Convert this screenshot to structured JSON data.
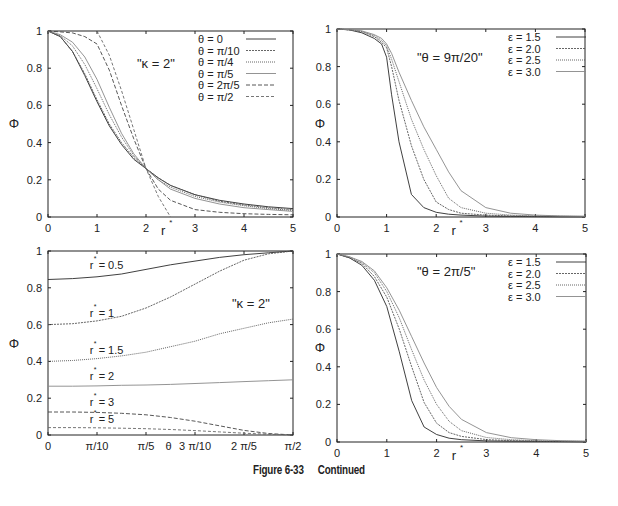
{
  "figure": {
    "caption_number": "Figure 6-33",
    "caption_text": "Continued"
  },
  "chart_data": [
    {
      "id": "top-left",
      "type": "line",
      "title": "",
      "annotation": "\"κ =  2\"",
      "xlabel": "r*",
      "ylabel": "Φ",
      "xlim": [
        0,
        5
      ],
      "ylim": [
        0,
        1
      ],
      "xticks": [
        "0",
        "1",
        "2",
        "3",
        "4",
        "5"
      ],
      "yticks": [
        "0",
        "0.2",
        "0.4",
        "0.6",
        "0.8",
        "1"
      ],
      "legend_position": "top-right",
      "grid": false,
      "x": [
        0,
        0.25,
        0.5,
        0.75,
        1.0,
        1.25,
        1.5,
        1.75,
        2.0,
        2.25,
        2.5,
        3.0,
        3.5,
        4.0,
        4.5,
        5.0
      ],
      "series": [
        {
          "name": "θ =  0",
          "dash": "",
          "values": [
            1.0,
            0.97,
            0.89,
            0.76,
            0.62,
            0.49,
            0.39,
            0.31,
            0.26,
            0.21,
            0.17,
            0.12,
            0.09,
            0.07,
            0.055,
            0.045
          ]
        },
        {
          "name": "θ =  π/10",
          "dash": "2,1",
          "values": [
            1.0,
            0.97,
            0.89,
            0.77,
            0.63,
            0.5,
            0.4,
            0.32,
            0.26,
            0.21,
            0.17,
            0.12,
            0.085,
            0.065,
            0.05,
            0.04
          ]
        },
        {
          "name": "θ =  π/4",
          "dash": "1,1",
          "values": [
            1.0,
            0.975,
            0.92,
            0.82,
            0.69,
            0.55,
            0.43,
            0.33,
            0.26,
            0.2,
            0.16,
            0.11,
            0.08,
            0.06,
            0.045,
            0.035
          ]
        },
        {
          "name": "θ =  π/5",
          "dash": "",
          "values": [
            1.0,
            0.98,
            0.94,
            0.86,
            0.74,
            0.59,
            0.45,
            0.34,
            0.26,
            0.2,
            0.15,
            0.1,
            0.07,
            0.05,
            0.04,
            0.03
          ]
        },
        {
          "name": "θ =  2π/5",
          "dash": "4,2",
          "values": [
            1.0,
            0.995,
            0.99,
            0.97,
            0.93,
            0.79,
            0.6,
            0.42,
            0.26,
            0.15,
            0.09,
            0.04,
            0.025,
            0.018,
            0.014,
            0.012
          ]
        },
        {
          "name": "θ =  π/2",
          "dash": "3,2",
          "values": [
            null,
            null,
            null,
            null,
            1.0,
            0.87,
            0.68,
            0.47,
            0.26,
            0.11,
            0.0,
            null,
            null,
            null,
            null,
            null
          ]
        }
      ]
    },
    {
      "id": "top-right",
      "type": "line",
      "annotation": "\"θ =  9π/20\"",
      "xlabel": "r*",
      "ylabel": "Φ",
      "xlim": [
        0,
        5
      ],
      "ylim": [
        0,
        1
      ],
      "xticks": [
        "0",
        "1",
        "2",
        "3",
        "4",
        "5"
      ],
      "yticks": [
        "0",
        "0.2",
        "0.4",
        "0.6",
        "0.8",
        "1"
      ],
      "legend_position": "top-right",
      "grid": false,
      "x": [
        0,
        0.25,
        0.5,
        0.75,
        0.9,
        1.0,
        1.1,
        1.25,
        1.5,
        1.75,
        2.0,
        2.25,
        2.5,
        3.0,
        3.5,
        4.0,
        4.5,
        5.0
      ],
      "series": [
        {
          "name": "ε = 1.5",
          "dash": "",
          "values": [
            1.0,
            0.995,
            0.98,
            0.95,
            0.92,
            0.85,
            0.65,
            0.4,
            0.12,
            0.05,
            0.025,
            0.015,
            0.01,
            0.005,
            0.003,
            0.002,
            0.001,
            0.001
          ]
        },
        {
          "name": "ε = 2.0",
          "dash": "2,1",
          "values": [
            1.0,
            0.995,
            0.985,
            0.96,
            0.93,
            0.9,
            0.8,
            0.62,
            0.38,
            0.2,
            0.08,
            0.04,
            0.02,
            0.01,
            0.006,
            0.004,
            0.003,
            0.002
          ]
        },
        {
          "name": "ε = 2.5",
          "dash": "1,1",
          "values": [
            1.0,
            0.996,
            0.988,
            0.965,
            0.94,
            0.91,
            0.84,
            0.72,
            0.52,
            0.36,
            0.22,
            0.1,
            0.05,
            0.02,
            0.01,
            0.006,
            0.004,
            0.003
          ]
        },
        {
          "name": "ε = 3.0",
          "dash": "",
          "values": [
            1.0,
            0.997,
            0.99,
            0.97,
            0.95,
            0.92,
            0.87,
            0.77,
            0.62,
            0.48,
            0.36,
            0.24,
            0.14,
            0.05,
            0.02,
            0.01,
            0.006,
            0.004
          ]
        }
      ]
    },
    {
      "id": "bottom-left",
      "type": "line",
      "annotation": "\"κ = 2\"",
      "xlabel": "θ",
      "ylabel": "Φ",
      "xlim": [
        0,
        1.5708
      ],
      "ylim": [
        0,
        1
      ],
      "xticks": [
        "0",
        "π/10",
        "π/5",
        "3 π/10",
        "2 π/5",
        "π/2"
      ],
      "yticks": [
        "0",
        "0.2",
        "0.4",
        "0.6",
        "0.8",
        "1"
      ],
      "grid": false,
      "x": [
        0,
        0.1,
        0.2,
        0.3,
        0.4,
        0.5,
        0.6,
        0.7,
        0.8,
        0.9,
        1.0
      ],
      "x_note": "fraction of π/2",
      "series": [
        {
          "name": "r* = 0.5",
          "label": "r* = 0.5",
          "dash": "",
          "values": [
            0.845,
            0.85,
            0.86,
            0.875,
            0.9,
            0.925,
            0.945,
            0.965,
            0.98,
            0.99,
            1.0
          ]
        },
        {
          "name": "r* = 1",
          "label": "r* = 1",
          "dash": "2,1",
          "values": [
            0.6,
            0.605,
            0.62,
            0.645,
            0.69,
            0.75,
            0.82,
            0.89,
            0.95,
            0.985,
            1.0
          ]
        },
        {
          "name": "r* = 1.5",
          "label": "r* = 1.5",
          "dash": "1,1",
          "values": [
            0.4,
            0.405,
            0.415,
            0.43,
            0.45,
            0.48,
            0.51,
            0.55,
            0.58,
            0.61,
            0.63
          ]
        },
        {
          "name": "r* = 2",
          "label": "r* = 2",
          "dash": "",
          "values": [
            0.265,
            0.265,
            0.267,
            0.27,
            0.272,
            0.275,
            0.28,
            0.285,
            0.29,
            0.295,
            0.3
          ]
        },
        {
          "name": "r* = 3",
          "label": "r* = 3",
          "dash": "4,2",
          "values": [
            0.125,
            0.125,
            0.123,
            0.118,
            0.11,
            0.095,
            0.075,
            0.05,
            0.025,
            0.008,
            0.0
          ]
        },
        {
          "name": "r* = 5",
          "label": "r* = 5",
          "dash": "3,2",
          "values": [
            0.04,
            0.04,
            0.039,
            0.037,
            0.034,
            0.03,
            0.024,
            0.017,
            0.01,
            0.004,
            0.0
          ]
        }
      ]
    },
    {
      "id": "bottom-right",
      "type": "line",
      "annotation": "\"θ = 2π/5\"",
      "xlabel": "r*",
      "ylabel": "Φ",
      "xlim": [
        0,
        5
      ],
      "ylim": [
        0,
        1
      ],
      "xticks": [
        "0",
        "1",
        "2",
        "3",
        "4",
        "5"
      ],
      "yticks": [
        "0",
        "0.2",
        "0.4",
        "0.6",
        "0.8",
        "1"
      ],
      "legend_position": "top-right",
      "grid": false,
      "x": [
        0,
        0.25,
        0.5,
        0.75,
        1.0,
        1.25,
        1.5,
        1.75,
        2.0,
        2.25,
        2.5,
        3.0,
        3.5,
        4.0,
        4.5,
        5.0
      ],
      "series": [
        {
          "name": "ε = 1.5",
          "dash": "",
          "values": [
            1.0,
            0.98,
            0.94,
            0.86,
            0.72,
            0.48,
            0.22,
            0.08,
            0.04,
            0.02,
            0.012,
            0.006,
            0.004,
            0.003,
            0.002,
            0.001
          ]
        },
        {
          "name": "ε = 2.0",
          "dash": "2,1",
          "values": [
            1.0,
            0.98,
            0.95,
            0.88,
            0.77,
            0.6,
            0.4,
            0.21,
            0.1,
            0.05,
            0.03,
            0.013,
            0.007,
            0.004,
            0.003,
            0.002
          ]
        },
        {
          "name": "ε = 2.5",
          "dash": "1,1",
          "values": [
            1.0,
            0.985,
            0.955,
            0.9,
            0.8,
            0.66,
            0.49,
            0.33,
            0.2,
            0.11,
            0.06,
            0.024,
            0.012,
            0.007,
            0.005,
            0.003
          ]
        },
        {
          "name": "ε = 3.0",
          "dash": "",
          "values": [
            1.0,
            0.985,
            0.96,
            0.91,
            0.82,
            0.7,
            0.56,
            0.42,
            0.29,
            0.19,
            0.12,
            0.05,
            0.023,
            0.012,
            0.007,
            0.005
          ]
        }
      ]
    }
  ],
  "colors": {
    "line_dark": "#333333",
    "line_light": "#777777",
    "frame": "#222222"
  }
}
